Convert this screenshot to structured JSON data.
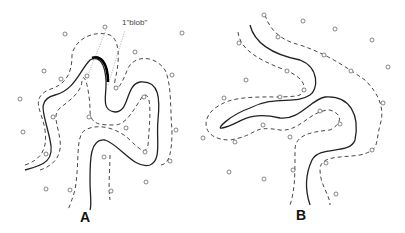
{
  "figure": {
    "panels": [
      {
        "label": "A",
        "annotation": "1\"blob\""
      },
      {
        "label": "B"
      }
    ]
  }
}
